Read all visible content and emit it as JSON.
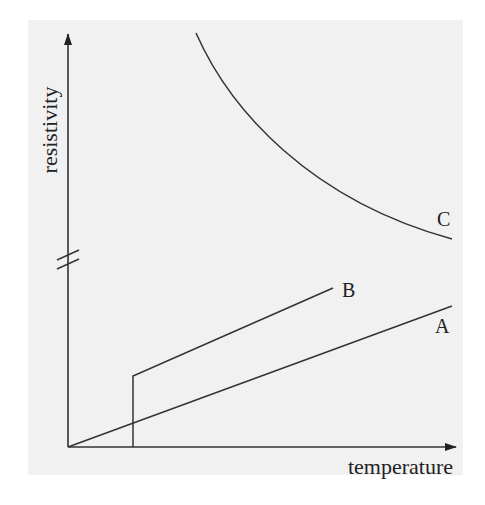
{
  "diagram": {
    "type": "resistivity vs temperature sketch",
    "axes": {
      "x_label": "temperature",
      "y_label": "resistivity",
      "y_axis_break": true
    },
    "curves": [
      {
        "label": "A",
        "description": "straight line rising from origin"
      },
      {
        "label": "B",
        "description": "zero below transition temperature, then jumps up and rises linearly"
      },
      {
        "label": "C",
        "description": "decreasing curve, high resistivity falling with temperature (above axis break)"
      }
    ]
  },
  "colors": {
    "background": "#f1f1f1",
    "ink": "#333333"
  }
}
